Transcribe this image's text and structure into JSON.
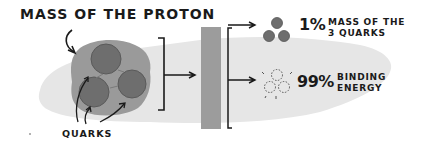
{
  "title": "MASS OF THE PROTON",
  "labels": {
    "quarks": "QUARKS"
  },
  "outcomes": [
    {
      "percent": "1%",
      "description_line1": "MASS OF THE",
      "description_line2": "3 QUARKS",
      "icon": "three-solid-quarks-icon"
    },
    {
      "percent": "99%",
      "description_line1": "BINDING",
      "description_line2": "ENERGY",
      "icon": "three-dashed-quarks-icon"
    }
  ],
  "colors": {
    "background_blob": "#e6e6e6",
    "proton_blob": "#9a9a9a",
    "quark_fill": "#6e6e6e",
    "bar": "#9c9c9c",
    "ink": "#1a1a1a"
  }
}
